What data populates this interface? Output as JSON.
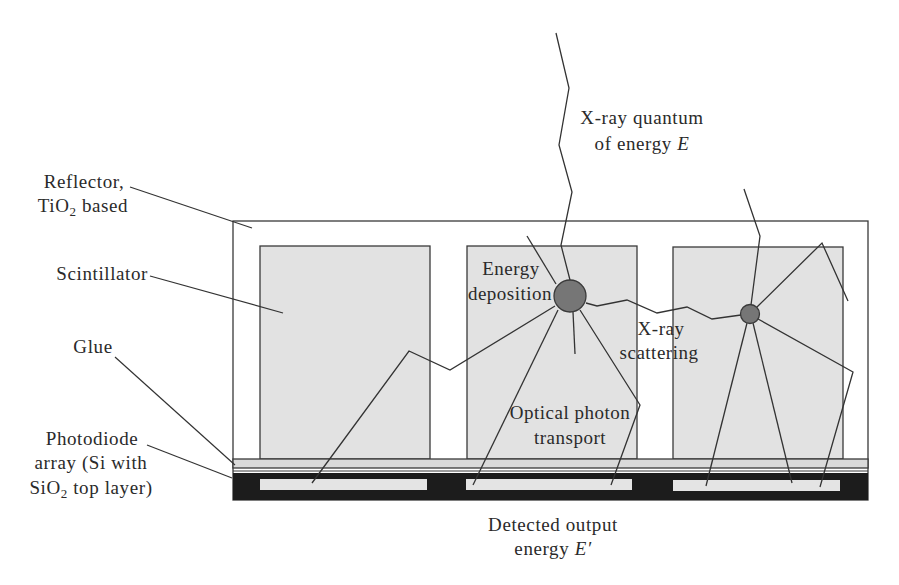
{
  "colors": {
    "background": "#ffffff",
    "reflector_fill": "#ffffff",
    "scintillator_fill": "#e2e2e2",
    "glue_fill": "#dadada",
    "photodiode_substrate_fill": "#1c1c1c",
    "pixel_fill": "#e4e4e4",
    "deposition_fill": "#767676",
    "outline": "#3a3a3a"
  },
  "labels": {
    "reflector": {
      "line1": "Reflector,",
      "line2_pre": "TiO",
      "line2_sub": "2",
      "line2_post": " based"
    },
    "scintillator": "Scintillator",
    "glue": "Glue",
    "photodiode": {
      "line1": "Photodiode",
      "line2": "array (Si with",
      "line3_pre": "SiO",
      "line3_sub": "2",
      "line3_post": " top layer)"
    },
    "xray_quantum": {
      "line1": "X-ray quantum",
      "line2_pre": "of energy ",
      "line2_var": "E"
    },
    "energy_deposition": {
      "line1": "Energy",
      "line2": "deposition"
    },
    "xray_scattering": {
      "line1": "X-ray",
      "line2": "scattering"
    },
    "optical_photon_transport": {
      "line1": "Optical photon",
      "line2": "transport"
    },
    "detected_output": {
      "line1": "Detected output",
      "line2_pre": "energy ",
      "line2_var": "E′"
    }
  },
  "structure": {
    "scintillator_count": 3,
    "photodiode_pixel_count": 3,
    "deposition_events": 2
  }
}
